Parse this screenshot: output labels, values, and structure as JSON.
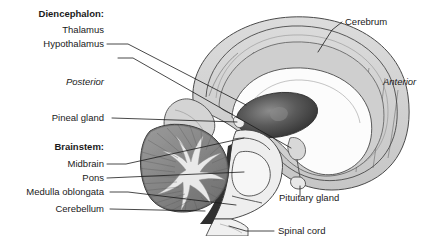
{
  "figure": {
    "background_color": "#ffffff",
    "text_color": "#1a1a1a",
    "line_color": "#4a4a4a"
  },
  "orientation": {
    "posterior": "Posterior",
    "anterior": "Anterior"
  },
  "groups": [
    {
      "id": "diencephalon",
      "label": "Diencephalon:"
    },
    {
      "id": "brainstem",
      "label": "Brainstem:"
    }
  ],
  "labels_left": [
    {
      "id": "thalamus",
      "label": "Thalamus"
    },
    {
      "id": "hypothalamus",
      "label": "Hypothalamus"
    },
    {
      "id": "pineal-gland",
      "label": "Pineal gland"
    },
    {
      "id": "midbrain",
      "label": "Midbrain"
    },
    {
      "id": "pons",
      "label": "Pons"
    },
    {
      "id": "medulla-oblongata",
      "label": "Medulla oblongata"
    },
    {
      "id": "cerebellum",
      "label": "Cerebellum"
    }
  ],
  "labels_right": [
    {
      "id": "cerebrum",
      "label": "Cerebrum"
    },
    {
      "id": "pituitary-gland",
      "label": "Pituitary gland"
    },
    {
      "id": "spinal-cord",
      "label": "Spinal cord"
    }
  ],
  "palette": {
    "cerebrum_fill": "#d4d4d4",
    "cerebrum_inner": "#c2c2c2",
    "corpus_callosum_fill": "#fcfcfc",
    "thalamus_fill": "#4d4d4d",
    "cerebellum_fill": "#8e8e8e",
    "cerebellum_cortex": "#7a7a7a",
    "arbor_vitae": "#e8e8e8",
    "brainstem_fill": "#ededed",
    "pons_fill": "#f4f4f4",
    "pineal_fill": "#e0e0e0",
    "dark_cleft": "#2b2b2b"
  }
}
